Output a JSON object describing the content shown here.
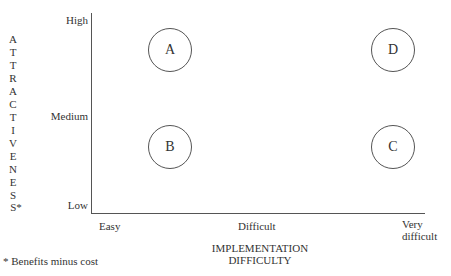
{
  "y_axis": {
    "title_letters": [
      "A",
      "T",
      "T",
      "R",
      "A",
      "C",
      "T",
      "I",
      "V",
      "E",
      "N",
      "E",
      "S",
      "S*"
    ],
    "title": "ATTRACTIVENESS*",
    "ticks": {
      "high": "High",
      "medium": "Medium",
      "low": "Low"
    }
  },
  "x_axis": {
    "title_line1": "IMPLEMENTATION",
    "title_line2": "DIFFICULTY",
    "ticks": {
      "easy": "Easy",
      "difficult": "Difficult",
      "very1": "Very",
      "very2": "difficult"
    }
  },
  "footnote": "* Benefits minus cost",
  "quadrants": [
    {
      "label": "A",
      "x": "Easy",
      "y": "High"
    },
    {
      "label": "B",
      "x": "Easy",
      "y": "Medium"
    },
    {
      "label": "C",
      "x": "Very difficult",
      "y": "Medium"
    },
    {
      "label": "D",
      "x": "Very difficult",
      "y": "High"
    }
  ],
  "colors": {
    "line": "#555555",
    "text": "#333333",
    "background": "#ffffff"
  }
}
